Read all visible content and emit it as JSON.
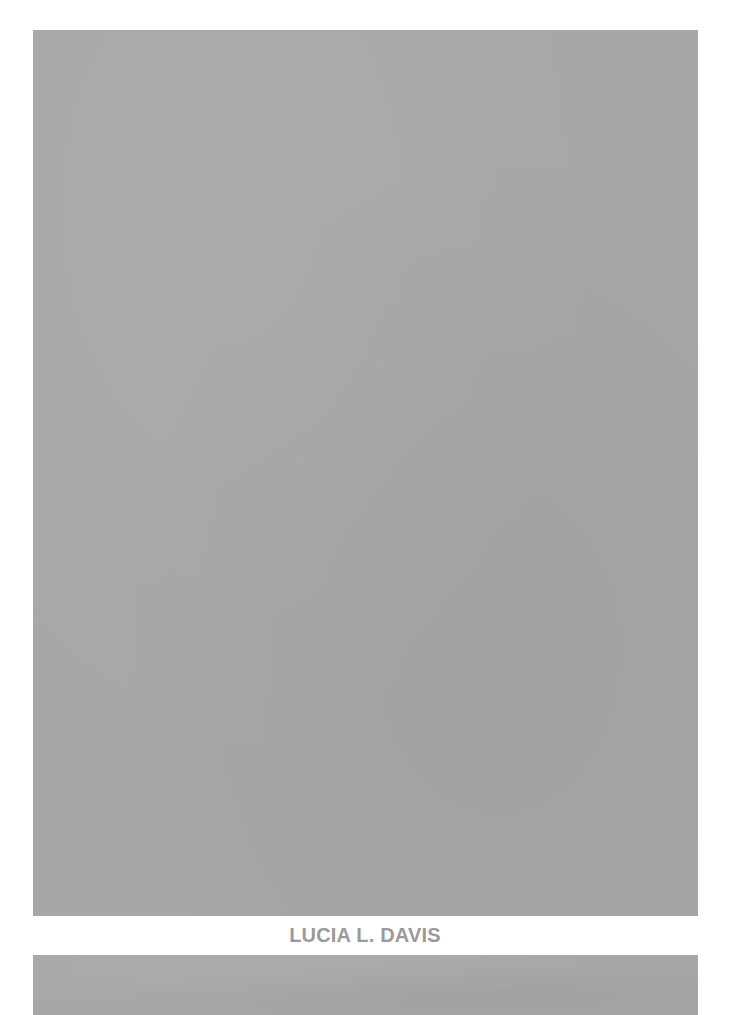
{
  "page": {
    "background_color": "#ffffff"
  },
  "panels": {
    "top": {
      "color": "#a7a7a7"
    },
    "bottom": {
      "color": "#a7a7a7"
    }
  },
  "caption": {
    "name": "LUCIA L. DAVIS",
    "color": "#9a9a9a"
  }
}
